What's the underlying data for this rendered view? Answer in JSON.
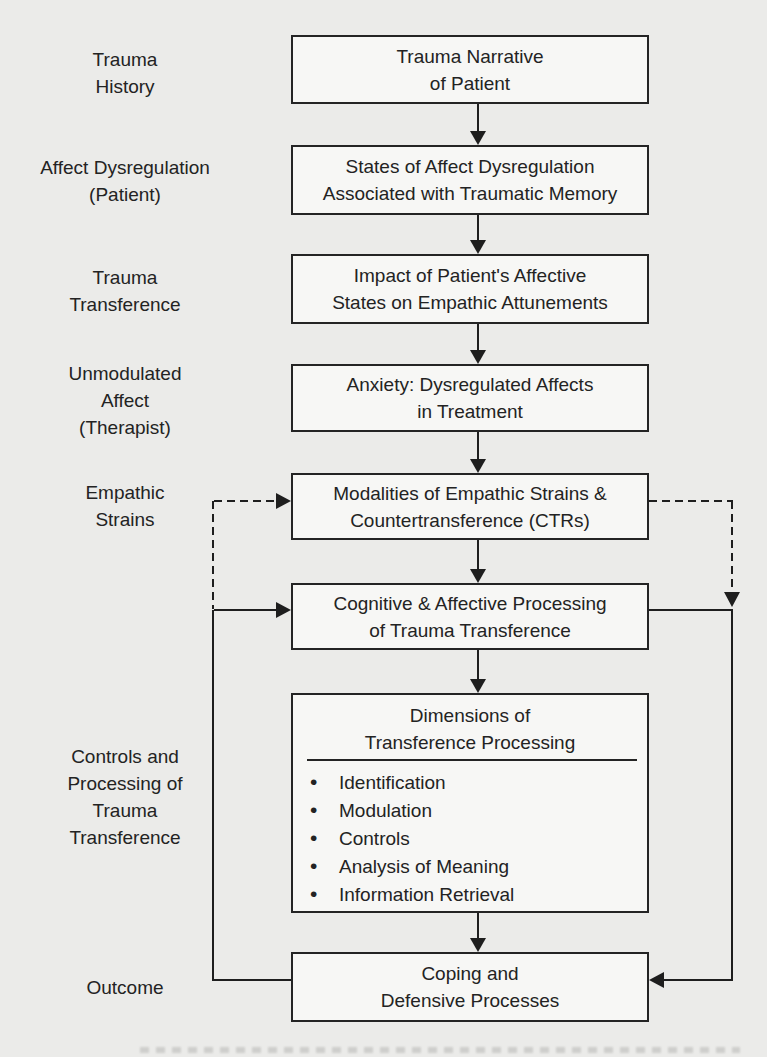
{
  "diagram": {
    "type": "flowchart",
    "colors": {
      "background": "#ebebe9",
      "box_fill": "#f7f7f5",
      "line": "#1e1e1e",
      "text": "#232323"
    },
    "side_labels": [
      {
        "text": "Trauma\nHistory"
      },
      {
        "text": "Affect Dysregulation\n(Patient)"
      },
      {
        "text": "Trauma\nTransference"
      },
      {
        "text": "Unmodulated\nAffect\n(Therapist)"
      },
      {
        "text": "Empathic\nStrains"
      },
      {
        "text": "Controls and\nProcessing of\nTrauma\nTransference"
      },
      {
        "text": "Outcome"
      }
    ],
    "boxes": [
      {
        "text": "Trauma Narrative\nof Patient"
      },
      {
        "text": "States of Affect Dysregulation\nAssociated with Traumatic Memory"
      },
      {
        "text": "Impact of Patient's Affective\nStates on Empathic Attunements"
      },
      {
        "text": "Anxiety: Dysregulated Affects\nin Treatment"
      },
      {
        "text": "Modalities of Empathic Strains &\nCountertransference (CTRs)"
      },
      {
        "text": "Cognitive & Affective Processing\nof Trauma Transference"
      },
      {
        "title": "Dimensions of\nTransference Processing",
        "bullets": [
          "Identification",
          "Modulation",
          "Controls",
          "Analysis of Meaning",
          "Information Retrieval"
        ],
        "bullet_glyph": "•"
      },
      {
        "text": "Coping and\nDefensive Processes"
      }
    ],
    "connections": [
      {
        "from": "Trauma Narrative of Patient",
        "to": "States of Affect Dysregulation Associated with Traumatic Memory",
        "style": "solid-arrow-down"
      },
      {
        "from": "States of Affect Dysregulation Associated with Traumatic Memory",
        "to": "Impact of Patient's Affective States on Empathic Attunements",
        "style": "solid-arrow-down"
      },
      {
        "from": "Impact of Patient's Affective States on Empathic Attunements",
        "to": "Anxiety: Dysregulated Affects in Treatment",
        "style": "solid-arrow-down"
      },
      {
        "from": "Anxiety: Dysregulated Affects in Treatment",
        "to": "Modalities of Empathic Strains & Countertransference (CTRs)",
        "style": "solid-arrow-down"
      },
      {
        "from": "Modalities of Empathic Strains & Countertransference (CTRs)",
        "to": "Cognitive & Affective Processing of Trauma Transference",
        "style": "solid-arrow-down"
      },
      {
        "from": "Cognitive & Affective Processing of Trauma Transference",
        "to": "Dimensions of Transference Processing",
        "style": "solid-arrow-down"
      },
      {
        "from": "Dimensions of Transference Processing",
        "to": "Coping and Defensive Processes",
        "style": "solid-arrow-down"
      },
      {
        "from": "Coping and Defensive Processes",
        "to": "Modalities of Empathic Strains & Countertransference (CTRs)",
        "style": "dashed-arrow",
        "via": "left-loop"
      },
      {
        "from": "Coping and Defensive Processes",
        "to": "Cognitive & Affective Processing of Trauma Transference",
        "style": "solid-arrow",
        "via": "left-loop"
      },
      {
        "from": "Modalities of Empathic Strains & Countertransference (CTRs)",
        "to": "Coping and Defensive Processes",
        "style": "dashed-arrow",
        "via": "right-loop"
      },
      {
        "from": "Cognitive & Affective Processing of Trauma Transference",
        "to": "Coping and Defensive Processes",
        "style": "solid-arrow",
        "via": "right-loop"
      }
    ]
  }
}
